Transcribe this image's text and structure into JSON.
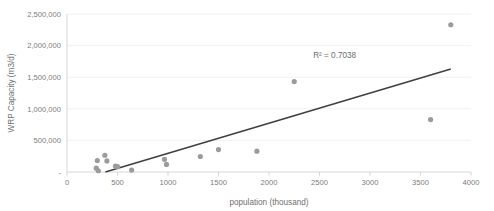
{
  "chart_data": {
    "type": "scatter",
    "title": "",
    "xlabel": "population (thousand)",
    "ylabel": "WRP Capacity (m3/d)",
    "xlim": [
      0,
      4000
    ],
    "ylim": [
      0,
      2500000
    ],
    "xticks": [
      0,
      500,
      1000,
      1500,
      2000,
      2500,
      3000,
      3500,
      4000
    ],
    "xtick_labels": [
      "0",
      "500",
      "1000",
      "1500",
      "2000",
      "2500",
      "3000",
      "3500",
      "4000"
    ],
    "yticks": [
      0,
      500000,
      1000000,
      1500000,
      2000000,
      2500000
    ],
    "ytick_labels": [
      "-",
      "500,000",
      "1,000,000",
      "1,500,000",
      "2,000,000",
      "2,500,000"
    ],
    "grid": "horizontal",
    "legend": "none",
    "point_color": "#9b9b9b",
    "trendline_color": "#3f3f3f",
    "gridline_color": "#ededed",
    "annotations": [
      {
        "text": "R² = 0.7038",
        "x": 2650,
        "y": 1800000
      }
    ],
    "series": [
      {
        "name": "WRP capacity vs population",
        "marker": "circle",
        "points": [
          {
            "x": 290,
            "y": 60000
          },
          {
            "x": 300,
            "y": 180000
          },
          {
            "x": 310,
            "y": 20000
          },
          {
            "x": 375,
            "y": 265000
          },
          {
            "x": 395,
            "y": 175000
          },
          {
            "x": 480,
            "y": 95000
          },
          {
            "x": 500,
            "y": 85000
          },
          {
            "x": 640,
            "y": 30000
          },
          {
            "x": 965,
            "y": 200000
          },
          {
            "x": 985,
            "y": 120000
          },
          {
            "x": 1320,
            "y": 245000
          },
          {
            "x": 1500,
            "y": 355000
          },
          {
            "x": 1880,
            "y": 330000
          },
          {
            "x": 2250,
            "y": 1430000
          },
          {
            "x": 3600,
            "y": 830000
          },
          {
            "x": 3800,
            "y": 2330000
          }
        ]
      }
    ],
    "trendline": {
      "type": "linear",
      "r_squared": 0.7038,
      "x_start": 380,
      "y_start": 0,
      "x_end": 3800,
      "y_end": 1630000
    }
  }
}
